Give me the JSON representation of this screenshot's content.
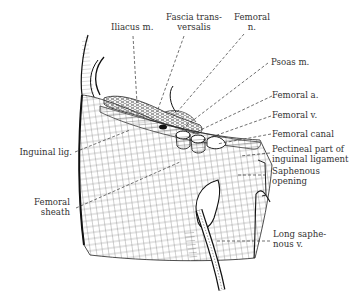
{
  "figure": {
    "labels": {
      "iliacus": "Iliacus m.",
      "fascia_line1": "Fascia trans-",
      "fascia_line2": "versalis",
      "femoral_n_line1": "Femoral",
      "femoral_n_line2": "n.",
      "psoas": "Psoas m.",
      "femoral_a": "Femoral a.",
      "femoral_v": "Femoral v.",
      "femoral_canal": "Femoral canal",
      "pectineal_line1": "Pectineal part of",
      "pectineal_line2": "inguinal ligament",
      "saphenous_line1": "Saphenous",
      "saphenous_line2": "opening",
      "long_saph_line1": "Long saphe-",
      "long_saph_line2": "nous v.",
      "inguinal": "Inguinal lig.",
      "sheath_line1": "Femoral",
      "sheath_line2": "sheath"
    },
    "colors": {
      "ink": "#222222",
      "background": "#ffffff"
    }
  }
}
